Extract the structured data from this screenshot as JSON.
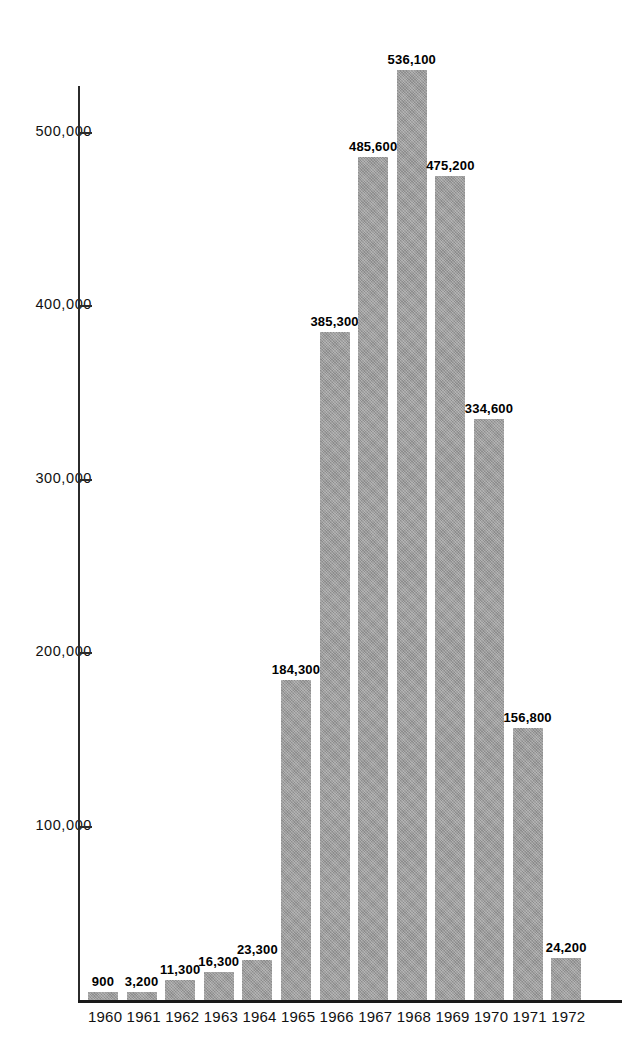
{
  "chart_data": {
    "type": "bar",
    "title": "",
    "subtitle": "",
    "xlabel": "",
    "ylabel": "",
    "categories": [
      "1960",
      "1961",
      "1962",
      "1963",
      "1964",
      "1965",
      "1966",
      "1967",
      "1968",
      "1969",
      "1970",
      "1971",
      "1972"
    ],
    "values": [
      900,
      3200,
      11300,
      16300,
      23300,
      184300,
      385300,
      485600,
      536100,
      475200,
      334600,
      156800,
      24200
    ],
    "value_labels": [
      "900",
      "3,200",
      "11,300",
      "16,300",
      "23,300",
      "184,300",
      "385,300",
      "485,600",
      "536,100",
      "475,200",
      "334,600",
      "156,800",
      "24,200"
    ],
    "series": [
      {
        "name": "",
        "values": [
          900,
          3200,
          11300,
          16300,
          23300,
          184300,
          385300,
          485600,
          536100,
          475200,
          334600,
          156800,
          24200
        ]
      }
    ],
    "ylim": [
      0,
      560000
    ],
    "ytick_values": [
      100000,
      200000,
      300000,
      400000,
      500000
    ],
    "ytick_labels": [
      "100,000",
      "200,000",
      "300,000",
      "400,000",
      "500,000"
    ],
    "grid": false,
    "legend": null,
    "legend_position": "none",
    "bar_color": "#9a9a9a",
    "axis_color": "#1a1a1a",
    "label_color": "#000000",
    "background": "#ffffff",
    "data_labels_shown": true
  }
}
